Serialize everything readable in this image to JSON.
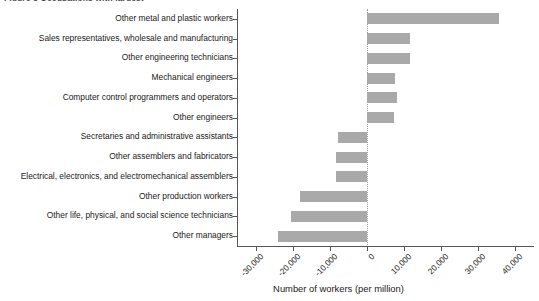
{
  "figure": {
    "top_partial_caption": "Figure 3   Occupations with largest",
    "bar_color": "#a9a9a9",
    "axis_color": "#555555",
    "zero_line_style": "dotted"
  },
  "chart_data": {
    "type": "bar",
    "orientation": "horizontal",
    "title": "",
    "xlabel": "Number of workers (per million)",
    "ylabel": "",
    "xlim": [
      -35000,
      45000
    ],
    "xticks": [
      -30000,
      -20000,
      -10000,
      0,
      10000,
      20000,
      30000,
      40000
    ],
    "xticklabels": [
      "-30,000",
      "-20,000",
      "-10,000",
      "0",
      "10,000",
      "20,000",
      "30,000",
      "40,000"
    ],
    "grid": false,
    "legend": false,
    "zero_reference_line": 0,
    "categories": [
      "Other metal and plastic workers",
      "Sales representatives, wholesale and manufacturing",
      "Other engineering technicians",
      "Mechanical engineers",
      "Computer control programmers and operators",
      "Other engineers",
      "Secretaries and administrative assistants",
      "Other assemblers and fabricators",
      "Electrical, electronics, and electromechanical assemblers",
      "Other production workers",
      "Other life, physical, and social science technicians",
      "Other managers"
    ],
    "values": [
      35500,
      11700,
      11700,
      7600,
      8100,
      7400,
      -7900,
      -8300,
      -8300,
      -18000,
      -20500,
      -24000
    ]
  }
}
